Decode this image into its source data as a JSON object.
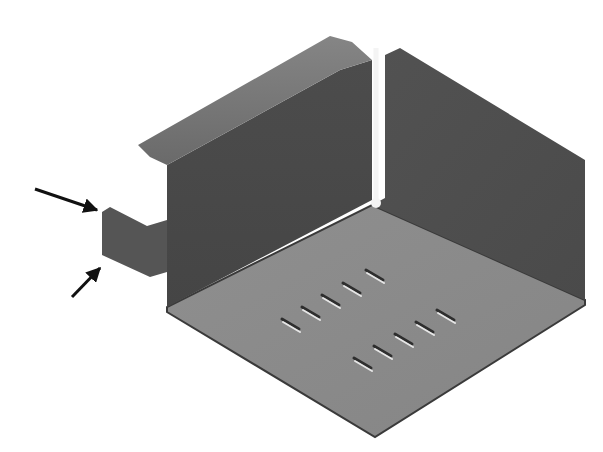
{
  "figure": {
    "title": "Sheet metal part with tab (isometric view)",
    "colors": {
      "background": "#ffffff",
      "wall_dark": "#4a4a4a",
      "wall_right": "#505050",
      "flange_top": "#7a7a7a",
      "floor": "#8a8a8a",
      "floor_edge": "#3a3a3a",
      "tab": "#555555",
      "slot_dark": "#2e2e2e",
      "slot_light": "#e6e6e6",
      "seam": "#f4f4f4",
      "arrow": "#111111"
    },
    "parts": {
      "left_wall": {
        "points": "167,165 340,70 372,60 372,200 167,307"
      },
      "left_flange_top": {
        "points": "138,145 330,36 352,42 372,60 340,70 167,165 150,157"
      },
      "right_wall": {
        "points": "385,55 400,48 585,160 585,300 372,205 385,198"
      },
      "floor": {
        "points": "372,205 585,300 585,305 375,437 167,312 167,307"
      },
      "tab": {
        "points": "102,212 110,207 147,226 167,220 167,272 150,277 102,255"
      },
      "seam": {
        "x": 376,
        "y1": 48,
        "y2": 200,
        "dot_r": 5
      }
    },
    "slots": [
      {
        "x1": 282,
        "y1": 320,
        "x2": 299,
        "y2": 330
      },
      {
        "x1": 302,
        "y1": 308,
        "x2": 319,
        "y2": 318
      },
      {
        "x1": 322,
        "y1": 296,
        "x2": 339,
        "y2": 306
      },
      {
        "x1": 343,
        "y1": 284,
        "x2": 360,
        "y2": 294
      },
      {
        "x1": 366,
        "y1": 271,
        "x2": 383,
        "y2": 281
      },
      {
        "x1": 354,
        "y1": 359,
        "x2": 371,
        "y2": 369
      },
      {
        "x1": 374,
        "y1": 347,
        "x2": 391,
        "y2": 357
      },
      {
        "x1": 395,
        "y1": 335,
        "x2": 412,
        "y2": 345
      },
      {
        "x1": 416,
        "y1": 323,
        "x2": 433,
        "y2": 333
      },
      {
        "x1": 437,
        "y1": 311,
        "x2": 454,
        "y2": 321
      }
    ],
    "arrows": [
      {
        "name": "upper-arrow",
        "x1": 35,
        "y1": 189,
        "x2": 97,
        "y2": 210
      },
      {
        "name": "lower-arrow",
        "x1": 72,
        "y1": 297,
        "x2": 100,
        "y2": 268
      }
    ]
  }
}
